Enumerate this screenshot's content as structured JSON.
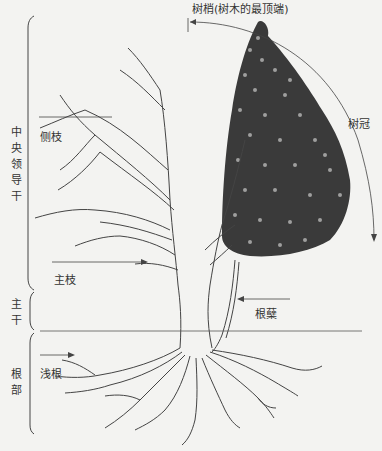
{
  "diagram": {
    "labels": {
      "treetop": "树梢(树木的最顶端)",
      "crown": "树冠",
      "lateral_branch": "侧枝",
      "main_branch": "主枝",
      "root_tiller": "根蘖",
      "shallow_root": "浅根",
      "central_leader": "中央领导干",
      "trunk": "主干",
      "root": "根部"
    },
    "colors": {
      "background": "#f3f3f1",
      "line": "#444444",
      "foliage": "#2a2a2a"
    }
  }
}
